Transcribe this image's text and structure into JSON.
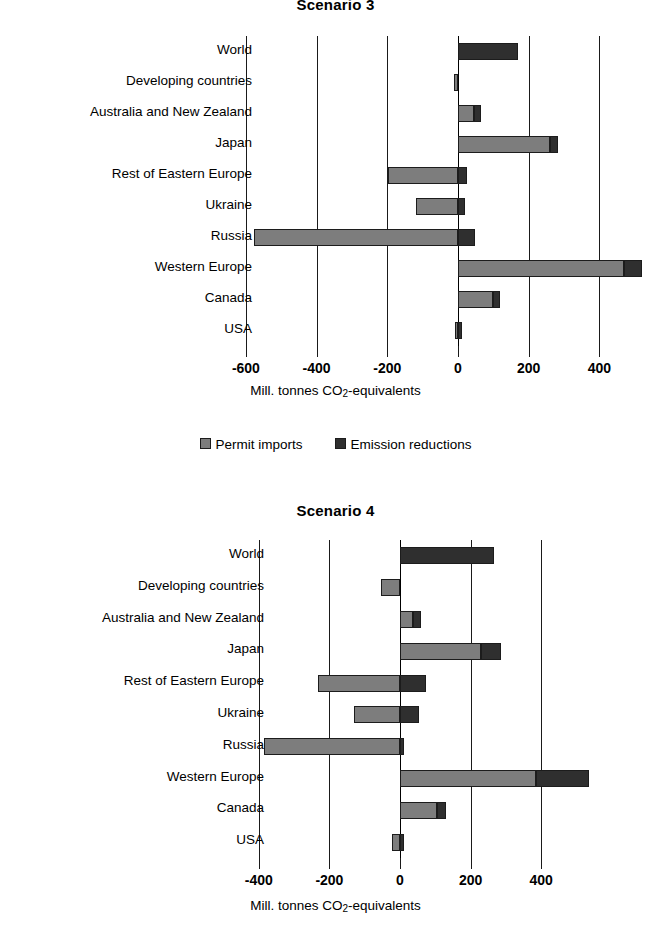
{
  "legend": {
    "items": [
      {
        "label": "Permit imports",
        "color": "#7d7d7d",
        "key": "permit"
      },
      {
        "label": "Emission reductions",
        "color": "#2f2f2f",
        "key": "emission"
      }
    ]
  },
  "axis_title": "Mill. tonnes CO2-equivalents",
  "axis_title_prefix": "Mill. tonnes CO",
  "axis_title_sub": "2",
  "axis_title_suffix": "-equivalents",
  "chart_data": [
    {
      "id": "scenario3",
      "type": "bar",
      "orientation": "horizontal",
      "stacked": true,
      "title": "Scenario 3",
      "xlabel": "Mill. tonnes CO2-equivalents",
      "ylabel": "",
      "xlim": [
        -680,
        560
      ],
      "xticks": [
        -600,
        -400,
        -200,
        0,
        200,
        400
      ],
      "xticklabels": [
        "-600",
        "-400",
        "-200",
        "0",
        "200",
        "400"
      ],
      "grid": true,
      "legend_position": "bottom",
      "categories": [
        "World",
        "Developing countries",
        "Australia and New Zealand",
        "Japan",
        "Rest of Eastern Europe",
        "Ukraine",
        "Russia",
        "Western Europe",
        "Canada",
        "USA"
      ],
      "series": [
        {
          "name": "Permit imports",
          "values": [
            0,
            -12,
            45,
            260,
            -197,
            -120,
            -578,
            470,
            100,
            -8
          ]
        },
        {
          "name": "Emission reductions",
          "values": [
            170,
            0,
            20,
            22,
            25,
            20,
            48,
            50,
            20,
            10
          ]
        }
      ]
    },
    {
      "id": "scenario4",
      "type": "bar",
      "orientation": "horizontal",
      "stacked": true,
      "title": "Scenario 4",
      "xlabel": "Mill. tonnes CO2-equivalents",
      "ylabel": "",
      "xlim": [
        -460,
        580
      ],
      "xticks": [
        -400,
        -200,
        0,
        200,
        400
      ],
      "xticklabels": [
        "-400",
        "-200",
        "0",
        "200",
        "400"
      ],
      "grid": true,
      "legend_position": "none",
      "categories": [
        "World",
        "Developing countries",
        "Australia and New Zealand",
        "Japan",
        "Rest of Eastern Europe",
        "Ukraine",
        "Russia",
        "Western Europe",
        "Canada",
        "USA"
      ],
      "series": [
        {
          "name": "Permit imports",
          "values": [
            0,
            -55,
            38,
            230,
            -232,
            -130,
            -385,
            385,
            105,
            -22
          ]
        },
        {
          "name": "Emission reductions",
          "values": [
            265,
            0,
            22,
            55,
            75,
            55,
            12,
            150,
            25,
            10
          ]
        }
      ]
    }
  ]
}
